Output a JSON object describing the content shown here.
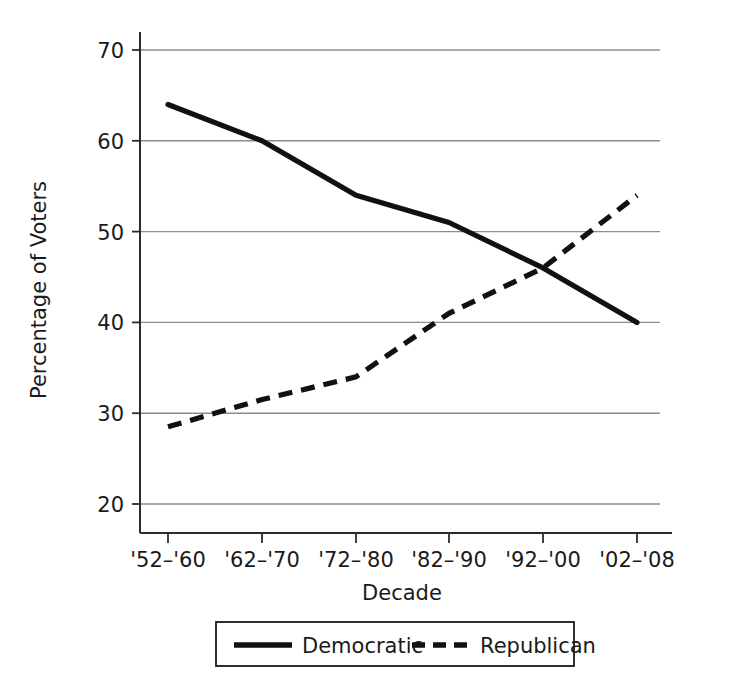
{
  "chart_data": {
    "type": "line",
    "title": "",
    "xlabel": "Decade",
    "ylabel": "Percentage of Voters",
    "categories": [
      "'52–'60",
      "'62–'70",
      "'72–'80",
      "'82–'90",
      "'92–'00",
      "'02–'08"
    ],
    "yticks": [
      "20",
      "30",
      "40",
      "50",
      "60",
      "70"
    ],
    "ytick_values": [
      20,
      30,
      40,
      50,
      60,
      70
    ],
    "ylim": [
      16,
      73
    ],
    "grid": "horizontal",
    "legend_position": "bottom-center",
    "series": [
      {
        "name": "Democratic",
        "style": "solid",
        "color": "#111111",
        "values": [
          64,
          60,
          54,
          51,
          46,
          40
        ]
      },
      {
        "name": "Republican",
        "style": "dashed",
        "color": "#111111",
        "values": [
          28.5,
          31.5,
          34,
          41,
          46,
          54
        ]
      }
    ]
  },
  "legend": {
    "items": [
      {
        "label": "Democratic",
        "style": "solid"
      },
      {
        "label": "Republican",
        "style": "dashed"
      }
    ]
  }
}
